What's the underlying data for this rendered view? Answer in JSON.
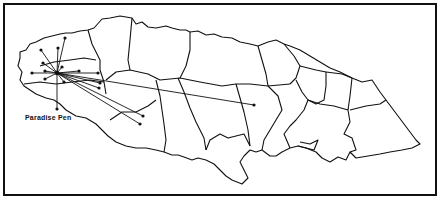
{
  "map": {
    "title": "Jamaica parish map",
    "hub": {
      "label": "Paradise Pen",
      "x": 57,
      "y": 73
    },
    "label_pos": {
      "x": 25,
      "y": 114
    },
    "line_color": "#111111",
    "background": "#ffffff",
    "destinations": [
      {
        "x": 41,
        "y": 50
      },
      {
        "x": 58,
        "y": 48
      },
      {
        "x": 65,
        "y": 38
      },
      {
        "x": 32,
        "y": 73
      },
      {
        "x": 45,
        "y": 71
      },
      {
        "x": 43,
        "y": 63
      },
      {
        "x": 62,
        "y": 67
      },
      {
        "x": 79,
        "y": 71
      },
      {
        "x": 98,
        "y": 73
      },
      {
        "x": 45,
        "y": 79
      },
      {
        "x": 64,
        "y": 82
      },
      {
        "x": 100,
        "y": 83
      },
      {
        "x": 99,
        "y": 88
      },
      {
        "x": 143,
        "y": 116
      },
      {
        "x": 140,
        "y": 124
      },
      {
        "x": 254,
        "y": 105
      },
      {
        "x": 57,
        "y": 109
      }
    ]
  }
}
